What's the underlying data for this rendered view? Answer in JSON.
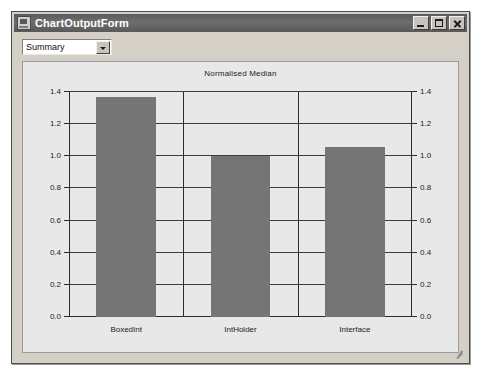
{
  "window": {
    "title": "ChartOutputForm",
    "icon": "form-icon",
    "buttons": {
      "minimize": "minimize-icon",
      "maximize": "maximize-icon",
      "close": "close-icon"
    }
  },
  "toolbar": {
    "mode_select": {
      "value": "Summary",
      "arrow": "chevron-down-icon"
    }
  },
  "chart_data": {
    "type": "bar",
    "title": "Normalised Median",
    "xlabel": "",
    "ylabel": "",
    "categories": [
      "BoxedInt",
      "IntHolder",
      "Interface"
    ],
    "values": [
      1.37,
      1.0,
      1.06
    ],
    "ylim": [
      0.0,
      1.4
    ],
    "ytick_values": [
      0.0,
      0.2,
      0.4,
      0.6,
      0.8,
      1.0,
      1.2,
      1.4
    ],
    "ytick_labels": [
      "0.0",
      "0.2",
      "0.4",
      "0.6",
      "0.8",
      "1.0",
      "1.2",
      "1.4"
    ],
    "dual_axis": true,
    "grid": true,
    "legend": null,
    "bar_color": "#757575",
    "plot_background": "#e8e8e8"
  }
}
